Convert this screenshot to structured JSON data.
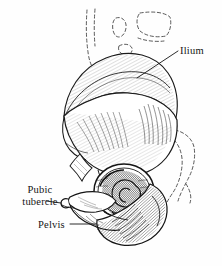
{
  "figure": {
    "kind": "anatomical-line-illustration",
    "style": "pen-and-ink engraving with cross-hatching",
    "background_color": "#fefefe",
    "ink_color": "#141414",
    "width": 222,
    "height": 266
  },
  "labels": {
    "ilium": {
      "text": "Ilium",
      "position": "upper-right",
      "leader": "line from text left edge down-left to iliac fossa"
    },
    "pubic_tubercle": {
      "line1": "Pubic",
      "line2": "tubercle",
      "position": "mid-left",
      "leader": "short horizontal line to pubic tubercle"
    },
    "pelvis": {
      "text": "Pelvis",
      "position": "lower-left",
      "leader": "horizontal line to inferior pubic ramus"
    }
  },
  "annotations": {
    "dashed_contours": "Adjacent bones (sacrum, vertebrae, femur) drawn as dashed outlines",
    "shaded_regions": "Iliac crest, acetabulum, ischial body rendered with dense hatching"
  }
}
